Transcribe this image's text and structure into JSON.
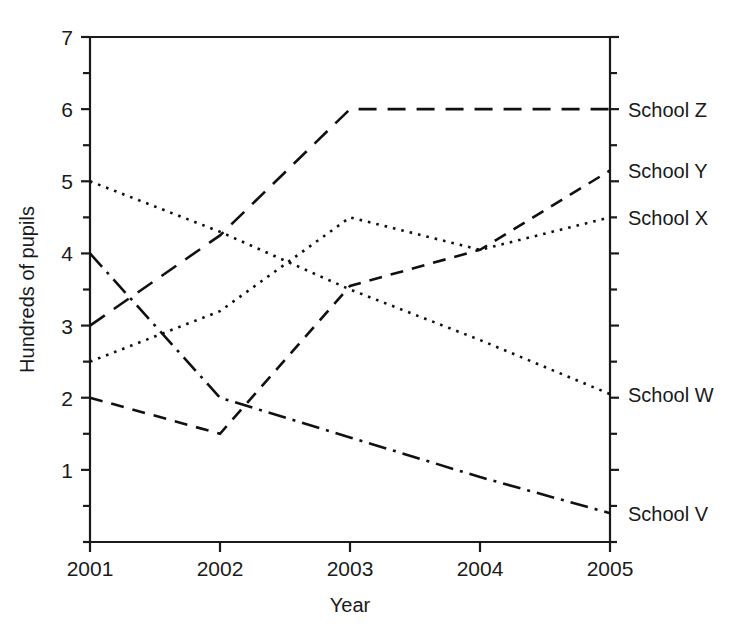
{
  "chart_data": {
    "type": "line",
    "title": "",
    "xlabel": "Year",
    "ylabel": "Hundreds of pupils",
    "categories": [
      "2001",
      "2002",
      "2003",
      "2004",
      "2005"
    ],
    "x": [
      2001,
      2002,
      2003,
      2004,
      2005
    ],
    "xlim": [
      2001,
      2005
    ],
    "ylim": [
      0,
      7
    ],
    "y_ticks_major": [
      "1",
      "2",
      "3",
      "4",
      "5",
      "6",
      "7"
    ],
    "y_tick_values": [
      1,
      2,
      3,
      4,
      5,
      6,
      7
    ],
    "y_minor_tick_values": [
      0,
      0.5,
      1.5,
      2.5,
      3.5,
      4.5,
      5.5,
      6.5
    ],
    "grid": false,
    "legend_position": "right-of-axis-inline",
    "series": [
      {
        "name": "School Z",
        "label": "School Z",
        "dash": "long-dash",
        "values": [
          3.0,
          4.25,
          6.0,
          6.0,
          6.0
        ],
        "label_value": 6.0
      },
      {
        "name": "School Y",
        "label": "School Y",
        "dash": "dash",
        "values": [
          2.0,
          1.5,
          3.55,
          4.05,
          5.15
        ],
        "label_value": 5.15
      },
      {
        "name": "School X",
        "label": "School X",
        "dash": "dotted",
        "values": [
          2.5,
          3.2,
          4.5,
          4.05,
          4.5
        ],
        "label_value": 4.5
      },
      {
        "name": "School W",
        "label": "School W",
        "dash": "dotted",
        "values": [
          5.0,
          4.3,
          3.5,
          2.8,
          2.05
        ],
        "label_value": 2.05
      },
      {
        "name": "School V",
        "label": "School V",
        "dash": "dash-dot",
        "values": [
          4.0,
          2.0,
          1.45,
          0.9,
          0.4
        ],
        "label_value": 0.4
      }
    ]
  },
  "axis": {
    "x_title": "Year",
    "y_title": "Hundreds of pupils"
  }
}
